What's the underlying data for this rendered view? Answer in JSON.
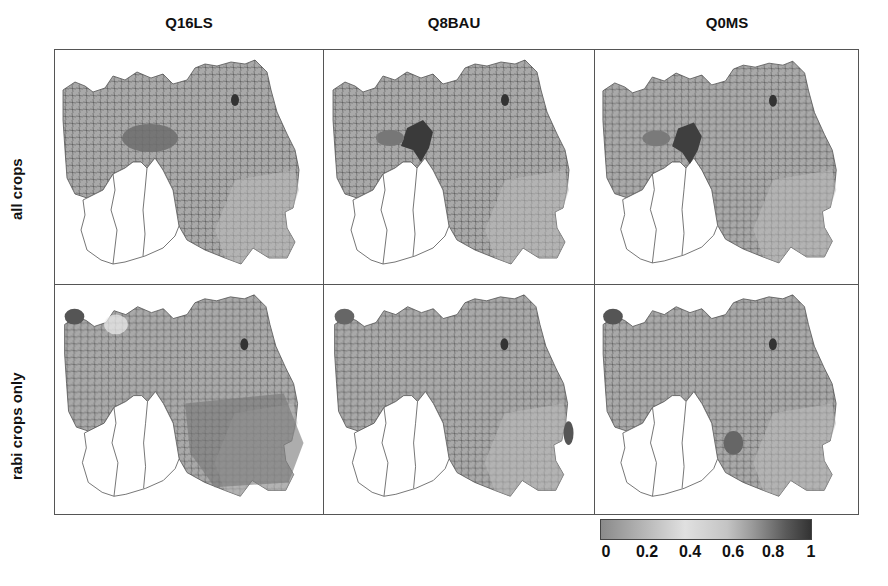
{
  "figure": {
    "columns": [
      "Q16LS",
      "Q8BAU",
      "Q0MS"
    ],
    "rows": [
      "all crops",
      "rabi crops only"
    ],
    "panels": [
      {
        "row": "all crops",
        "column": "Q16LS",
        "hotspot_intensity": 0.7
      },
      {
        "row": "all crops",
        "column": "Q8BAU",
        "hotspot_intensity": 0.95
      },
      {
        "row": "all crops",
        "column": "Q0MS",
        "hotspot_intensity": 0.9
      },
      {
        "row": "rabi crops only",
        "column": "Q16LS",
        "hotspot_intensity": 0.75
      },
      {
        "row": "rabi crops only",
        "column": "Q8BAU",
        "hotspot_intensity": 0.55
      },
      {
        "row": "rabi crops only",
        "column": "Q0MS",
        "hotspot_intensity": 0.6
      }
    ]
  },
  "legend": {
    "ticks": [
      "0",
      "0.2",
      "0.4",
      "0.6",
      "0.8",
      "1"
    ],
    "range": [
      0,
      1
    ],
    "colormap": "grey diverging (mid-grey → light at 0.4 → dark at 1)"
  }
}
